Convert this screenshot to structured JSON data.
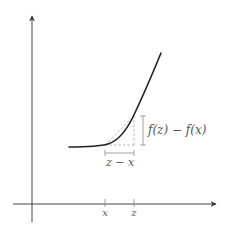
{
  "diagram": {
    "type": "function-difference-illustration",
    "colors": {
      "axis": "#444444",
      "curve": "#222222",
      "guide": "#999999",
      "label": "#555555",
      "background": "#ffffff"
    },
    "axes": {
      "x_axis": {
        "has_arrow": true
      },
      "y_axis": {
        "has_arrow": true
      }
    },
    "ticks": [
      {
        "label": "x"
      },
      {
        "label": "z"
      }
    ],
    "brackets": {
      "vertical_label": "f(z) − f(x)",
      "horizontal_label": "z − x"
    },
    "curve": {
      "description": "convex increasing curve, flat on the left then rising steeply"
    }
  }
}
